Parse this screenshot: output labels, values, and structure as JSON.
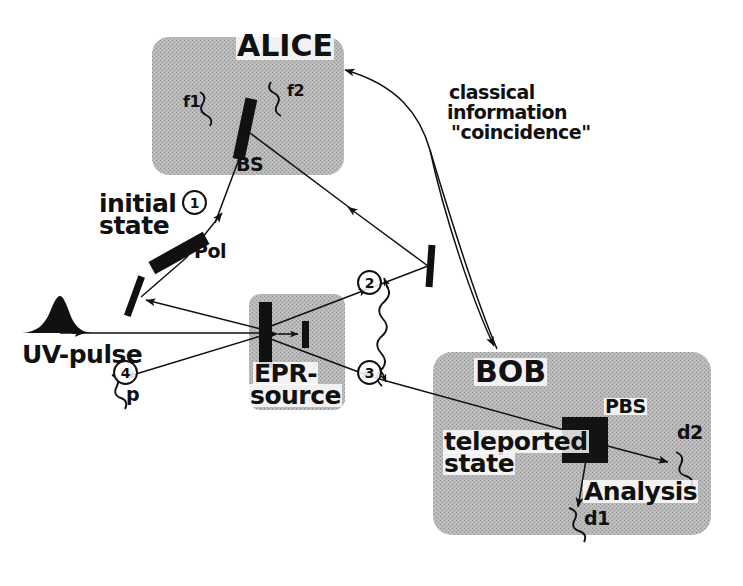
{
  "figure": {
    "background_color": "#ffffff",
    "ink_color": "#111111",
    "box_fill_color": "#b4b4b4"
  },
  "boxes": [
    {
      "id": "alice",
      "label": "ALICE",
      "x": 152,
      "y": 37,
      "w": 192,
      "h": 138
    },
    {
      "id": "epr",
      "label_line1": "EPR-",
      "label_line2": "source",
      "x": 249,
      "y": 294,
      "w": 96,
      "h": 116
    },
    {
      "id": "bob",
      "label": "BOB",
      "x": 433,
      "y": 352,
      "w": 278,
      "h": 183
    }
  ],
  "labels": {
    "alice": "ALICE",
    "bob": "BOB",
    "epr_line1": "EPR-",
    "epr_line2": "source",
    "beam_splitter": "BS",
    "detector_f1": "f1",
    "detector_f2": "f2",
    "polarizer": "Pol",
    "initial_state_line1": "initial",
    "initial_state_line2": "state",
    "uv_pulse": "UV-pulse",
    "photon_p": "p",
    "classical_line1": "classical",
    "classical_line2": "information",
    "classical_line3": "\"coincidence\"",
    "pbs": "PBS",
    "teleported_line1": "teleported",
    "teleported_line2": "state",
    "analysis": "Analysis",
    "detector_d1": "d1",
    "detector_d2": "d2"
  },
  "photon_numbers": [
    {
      "id": "photon-1",
      "text": "1",
      "x": 182,
      "y": 190
    },
    {
      "id": "photon-2",
      "text": "2",
      "x": 357,
      "y": 270
    },
    {
      "id": "photon-3",
      "text": "3",
      "x": 357,
      "y": 360
    },
    {
      "id": "photon-4",
      "text": "4",
      "x": 113,
      "y": 360
    }
  ],
  "optics": [
    {
      "id": "beam-splitter",
      "kind": "thick-bar",
      "label": "BS"
    },
    {
      "id": "polarizer",
      "kind": "thick-bar",
      "label": "Pol"
    },
    {
      "id": "steering-mirror-left",
      "kind": "thin-bar",
      "label": ""
    },
    {
      "id": "steering-mirror-right",
      "kind": "thin-bar",
      "label": ""
    },
    {
      "id": "bbo-crystal",
      "kind": "thick-bar",
      "label": ""
    },
    {
      "id": "compensator",
      "kind": "thin-bar",
      "label": ""
    },
    {
      "id": "polarizing-beam-splitter",
      "kind": "dark-square",
      "label": "PBS"
    }
  ],
  "icons": {
    "uv_pulse": "pulse-envelope-icon",
    "entanglement": "wavy-entanglement-icon",
    "detector": "squiggle-detector-icon",
    "classical_channel": "curved-arrow-icon"
  }
}
